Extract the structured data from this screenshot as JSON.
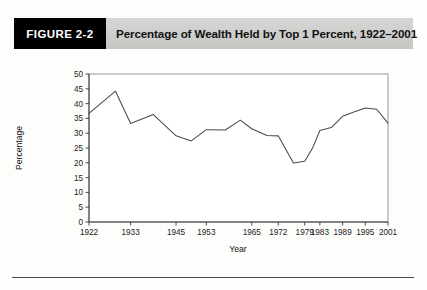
{
  "figure": {
    "tag_label": "FIGURE 2-2",
    "title": "Percentage of Wealth Held by Top 1 Percent, 1922–2001"
  },
  "chart_data": {
    "type": "line",
    "title": "Percentage of Wealth Held by Top 1 Percent, 1922–2001",
    "xlabel": "Year",
    "ylabel": "Percentage",
    "xlim": [
      1922,
      2001
    ],
    "ylim": [
      0,
      50
    ],
    "y_ticks": [
      0,
      5,
      10,
      15,
      20,
      25,
      30,
      35,
      40,
      45,
      50
    ],
    "x_ticks": [
      1922,
      1933,
      1945,
      1953,
      1965,
      1972,
      1979,
      1983,
      1989,
      1995,
      2001
    ],
    "x_tick_labels": [
      "1922",
      "1933",
      "1945",
      "1953",
      "1965",
      "1972",
      "1979",
      "1983",
      "1989",
      "1995",
      "2001"
    ],
    "grid": false,
    "legend": false,
    "line_color": "#4a4a4a",
    "series": [
      {
        "name": "Percentage of wealth held by top 1 percent",
        "x": [
          1922,
          1929,
          1933,
          1939,
          1945,
          1949,
          1953,
          1958,
          1962,
          1965,
          1969,
          1972,
          1976,
          1979,
          1981,
          1983,
          1986,
          1989,
          1992,
          1995,
          1998,
          2001
        ],
        "values": [
          36.7,
          44.2,
          33.3,
          36.3,
          29.1,
          27.4,
          31.2,
          31.1,
          34.4,
          31.5,
          29.2,
          29.1,
          19.9,
          20.5,
          24.8,
          30.9,
          31.9,
          35.7,
          37.2,
          38.5,
          38.1,
          33.4
        ]
      }
    ]
  },
  "colors": {
    "header_band": "#cfcfcd",
    "tag_background": "#000000",
    "line": "#4a4a4a",
    "axis": "#3a3a3a"
  }
}
